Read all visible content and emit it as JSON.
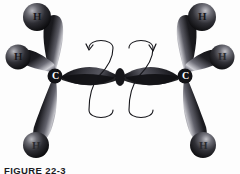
{
  "figure": {
    "caption": "FIGURE 22-3",
    "background_color": "#fdfdfd",
    "ink_color": "#1b1b1f"
  },
  "molecule": {
    "name": "ethylene-orbital-model",
    "carbon_labels": [
      {
        "text": "C",
        "position": "left-carbon"
      },
      {
        "text": "C",
        "position": "right-carbon"
      }
    ],
    "hydrogen_labels": [
      {
        "text": "H",
        "position": "upper-left"
      },
      {
        "text": "H",
        "position": "mid-left"
      },
      {
        "text": "H",
        "position": "lower-left"
      },
      {
        "text": "H",
        "position": "upper-right"
      },
      {
        "text": "H",
        "position": "mid-right"
      },
      {
        "text": "H",
        "position": "lower-right"
      }
    ],
    "rotation_arrows": [
      {
        "name": "left-rotation-arrow",
        "direction": "counterclockwise"
      },
      {
        "name": "right-rotation-arrow",
        "direction": "clockwise"
      }
    ],
    "orbital_colors": {
      "lobe_dark": "#141417",
      "lobe_mid": "#3a3a40",
      "lobe_highlight": "#d8d8dc",
      "sphere_dark": "#0e0e11",
      "sphere_mid": "#45454c",
      "sphere_highlight": "#c9c9ce"
    }
  }
}
